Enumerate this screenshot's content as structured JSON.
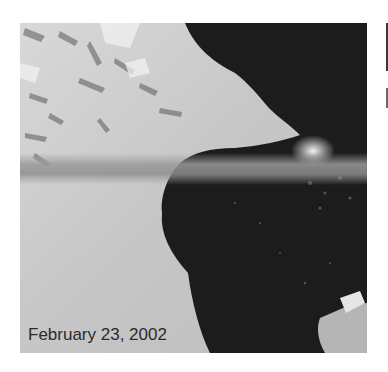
{
  "image": {
    "description": "Grayscale satellite image of ice shelf edge with dark open water bay",
    "caption": "February 23, 2002"
  },
  "colors": {
    "ice": "#c9c9c9",
    "ice_light": "#dedede",
    "water": "#1c1c1c",
    "band": "#8a8a8a",
    "caption_text": "#2a2a2a"
  }
}
